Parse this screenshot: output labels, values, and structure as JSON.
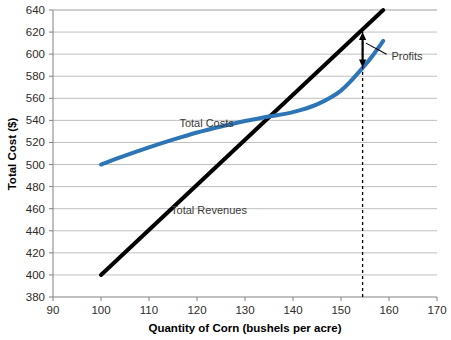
{
  "chart_data": {
    "type": "line",
    "title": "",
    "xlabel": "Quantity of Corn (bushels per acre)",
    "ylabel": "Total Cost ($)",
    "xlim": [
      90,
      170
    ],
    "ylim": [
      380,
      640
    ],
    "xticks": [
      90,
      100,
      110,
      120,
      130,
      140,
      150,
      160,
      170
    ],
    "yticks": [
      380,
      400,
      420,
      440,
      460,
      480,
      500,
      520,
      540,
      560,
      580,
      600,
      620,
      640
    ],
    "xtick_labels": [
      "90",
      "100",
      "110",
      "120",
      "130",
      "140",
      "150",
      "160",
      "170"
    ],
    "ytick_labels": [
      "380",
      "400",
      "420",
      "440",
      "460",
      "480",
      "500",
      "520",
      "540",
      "560",
      "580",
      "600",
      "620",
      "640"
    ],
    "grid": {
      "horizontal": true,
      "vertical": false,
      "color": "#BFBFBF"
    },
    "legend": {
      "position": "inline-labels"
    },
    "series": [
      {
        "name": "Total Revenues",
        "type": "line",
        "color": "#000000",
        "width": 4,
        "label_text": "Total Revenues",
        "label_x": 122.5,
        "label_y": 455,
        "points": [
          {
            "x": 100,
            "y": 400
          },
          {
            "x": 158.8,
            "y": 640
          }
        ]
      },
      {
        "name": "Total Costs",
        "type": "curve",
        "color": "#2E75B6",
        "width": 4,
        "label_text": "Total Costs",
        "label_x": 122.0,
        "label_y": 534,
        "points": [
          {
            "x": 100.0,
            "y": 500.0
          },
          {
            "x": 105.0,
            "y": 508.0
          },
          {
            "x": 110.0,
            "y": 515.5
          },
          {
            "x": 115.0,
            "y": 522.5
          },
          {
            "x": 120.0,
            "y": 529.0
          },
          {
            "x": 125.0,
            "y": 534.5
          },
          {
            "x": 130.0,
            "y": 539.5
          },
          {
            "x": 135.0,
            "y": 543.5
          },
          {
            "x": 140.0,
            "y": 547.5
          },
          {
            "x": 145.0,
            "y": 554.5
          },
          {
            "x": 150.0,
            "y": 567.0
          },
          {
            "x": 154.5,
            "y": 587.5
          },
          {
            "x": 157.0,
            "y": 601.0
          },
          {
            "x": 158.8,
            "y": 612.0
          }
        ]
      }
    ],
    "annotations": [
      {
        "name": "optimal-quantity-line",
        "type": "vertical-dashed-line",
        "x": 154.5,
        "y_from": 380,
        "y_to": 620,
        "color": "#000000"
      },
      {
        "name": "profits-arrow",
        "type": "double-arrow",
        "x": 154.5,
        "y_from": 588,
        "y_to": 620,
        "color": "#000000"
      },
      {
        "name": "profits-label",
        "type": "text",
        "text": "Profits",
        "x": 160.5,
        "y": 598,
        "leader_from_x": 159.5,
        "leader_from_y": 600,
        "leader_to_x": 155.2,
        "leader_to_y": 610
      }
    ]
  },
  "axis": {
    "y_title": "Total Cost ($)",
    "x_title": "Quantity of Corn (bushels per acre)"
  },
  "labels": {
    "total_costs": "Total Costs",
    "total_revenues": "Total Revenues",
    "profits": "Profits"
  }
}
